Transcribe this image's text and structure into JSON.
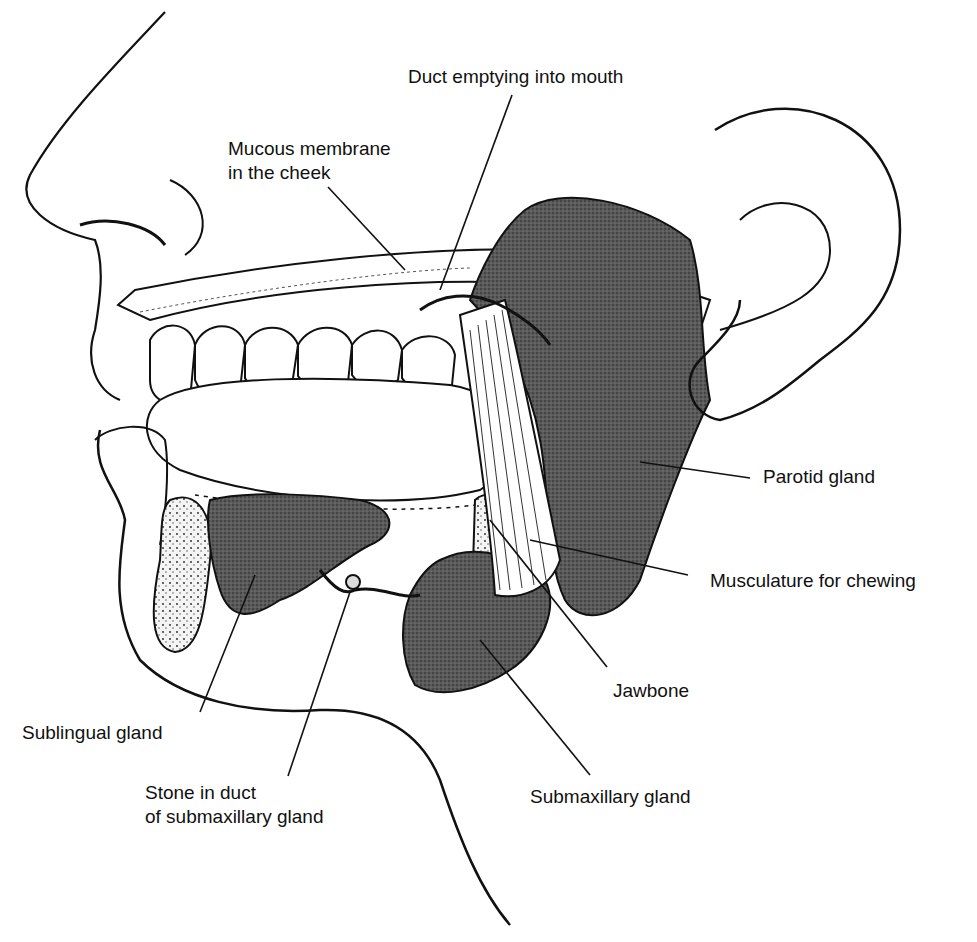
{
  "labels": {
    "duct": "Duct emptying into mouth",
    "mucous_1": "Mucous membrane",
    "mucous_2": "in the cheek",
    "parotid": "Parotid gland",
    "muscle": "Musculature for chewing",
    "jawbone": "Jawbone",
    "sublingual": "Sublingual gland",
    "stone_1": "Stone in duct",
    "stone_2": "of submaxillary gland",
    "submax": "Submaxillary gland"
  },
  "colors": {
    "ink": "#111111",
    "gland": "#4a4a4a",
    "paper": "#ffffff"
  }
}
